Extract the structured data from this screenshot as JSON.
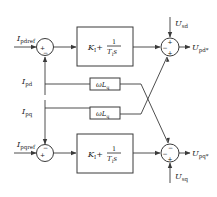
{
  "diagram": {
    "type": "block-diagram",
    "inputs": {
      "i_pdref": {
        "main": "I",
        "sub": "pdref"
      },
      "i_pqref": {
        "main": "I",
        "sub": "pqref"
      },
      "i_pd": {
        "main": "I",
        "sub": "pd"
      },
      "i_pq": {
        "main": "I",
        "sub": "pq"
      },
      "u_sd": {
        "main": "U",
        "sub": "sd"
      },
      "u_sq": {
        "main": "U",
        "sub": "sq"
      }
    },
    "outputs": {
      "u_pd": {
        "main": "U",
        "sub": "pd*"
      },
      "u_pq": {
        "main": "U",
        "sub": "pq*"
      }
    },
    "blocks": {
      "pi_top": {
        "k": "K",
        "k_sub": "I",
        "plus": "+",
        "num": "1",
        "den_T": "T",
        "den_sub": "I",
        "den_s": "s"
      },
      "pi_bottom": {
        "k": "K",
        "k_sub": "I",
        "plus": "+",
        "num": "1",
        "den_T": "T",
        "den_sub": "I",
        "den_s": "s"
      },
      "decouple_top": {
        "omega": "ω",
        "L": "L",
        "sub": "q"
      },
      "decouple_bottom": {
        "omega": "ω",
        "L": "L",
        "sub": "q"
      }
    },
    "summers": {
      "left_top": {
        "signs": [
          "+",
          "−"
        ]
      },
      "left_bottom": {
        "signs": [
          "−",
          "+"
        ]
      },
      "right_top": {
        "signs": [
          "+",
          "−",
          "+"
        ]
      },
      "right_bottom": {
        "signs": [
          "−",
          "−",
          "+"
        ]
      }
    }
  }
}
